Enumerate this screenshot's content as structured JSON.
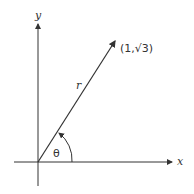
{
  "diagram": {
    "type": "polar-coordinate-diagram",
    "axes": {
      "x_label": "x",
      "y_label": "y"
    },
    "point_label": "(1,√3)",
    "radius_label": "r",
    "angle_label": "θ",
    "colors": {
      "stroke": "#333333",
      "text": "#333333"
    }
  }
}
